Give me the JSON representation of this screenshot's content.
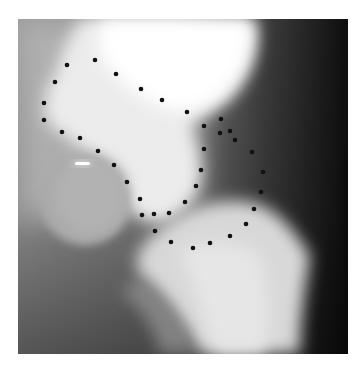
{
  "figure": {
    "type": "radiograph",
    "frame": {
      "x": 18,
      "y": 19,
      "width": 330,
      "height": 335
    },
    "dot_color": "#111111",
    "dot_radius": 2.3,
    "landmarks": [
      {
        "x": 95,
        "y": 60
      },
      {
        "x": 67,
        "y": 65
      },
      {
        "x": 116,
        "y": 74
      },
      {
        "x": 55,
        "y": 82
      },
      {
        "x": 141,
        "y": 89
      },
      {
        "x": 162,
        "y": 100
      },
      {
        "x": 44,
        "y": 103
      },
      {
        "x": 187,
        "y": 112
      },
      {
        "x": 44,
        "y": 120
      },
      {
        "x": 62,
        "y": 132
      },
      {
        "x": 80,
        "y": 138
      },
      {
        "x": 98,
        "y": 151
      },
      {
        "x": 114,
        "y": 165
      },
      {
        "x": 127,
        "y": 182
      },
      {
        "x": 140,
        "y": 199
      },
      {
        "x": 142,
        "y": 215
      },
      {
        "x": 154,
        "y": 214
      },
      {
        "x": 169,
        "y": 213
      },
      {
        "x": 155,
        "y": 231
      },
      {
        "x": 204,
        "y": 126
      },
      {
        "x": 221,
        "y": 119
      },
      {
        "x": 220,
        "y": 133
      },
      {
        "x": 230,
        "y": 131
      },
      {
        "x": 235,
        "y": 140
      },
      {
        "x": 204,
        "y": 149
      },
      {
        "x": 252,
        "y": 152
      },
      {
        "x": 201,
        "y": 170
      },
      {
        "x": 263,
        "y": 172
      },
      {
        "x": 196,
        "y": 186
      },
      {
        "x": 261,
        "y": 192
      },
      {
        "x": 185,
        "y": 202
      },
      {
        "x": 254,
        "y": 209
      },
      {
        "x": 246,
        "y": 224
      },
      {
        "x": 230,
        "y": 236
      },
      {
        "x": 210,
        "y": 243
      },
      {
        "x": 193,
        "y": 248
      },
      {
        "x": 171,
        "y": 242
      }
    ]
  }
}
